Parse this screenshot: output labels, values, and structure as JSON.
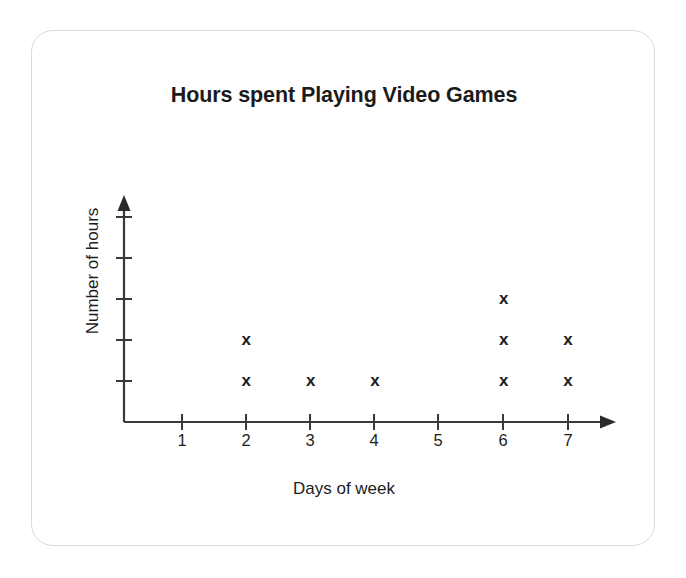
{
  "chart_data": {
    "type": "scatter",
    "plot_style": "dot-plot",
    "title": "Hours spent Playing Video Games",
    "xlabel": "Days of week",
    "ylabel": "Number of hours",
    "marker": "x",
    "categories": [
      "1",
      "2",
      "3",
      "4",
      "5",
      "6",
      "7"
    ],
    "values": [
      0,
      2,
      1,
      1,
      0,
      3,
      2
    ],
    "x": [
      1,
      2,
      3,
      4,
      5,
      6,
      7
    ],
    "xlim": [
      0,
      7.6
    ],
    "ylim": [
      0,
      5.5
    ],
    "x_tick_labels": [
      "1",
      "2",
      "3",
      "4",
      "5",
      "6",
      "7"
    ],
    "y_tick_labels": [
      "",
      "",
      "",
      "",
      ""
    ],
    "y_tick_count": 5,
    "grid": false,
    "legend": false,
    "axis_arrows": true,
    "points": [
      {
        "x": 2,
        "y": 1
      },
      {
        "x": 2,
        "y": 2
      },
      {
        "x": 3,
        "y": 1
      },
      {
        "x": 4,
        "y": 1
      },
      {
        "x": 6,
        "y": 1
      },
      {
        "x": 6,
        "y": 2
      },
      {
        "x": 6,
        "y": 3
      },
      {
        "x": 7,
        "y": 1
      },
      {
        "x": 7,
        "y": 2
      }
    ]
  },
  "colors": {
    "ink": "#1d1d1d",
    "title": "#1b1b1b",
    "axis": "#3a3a3a",
    "card_border": "#d9d9d9",
    "background": "#ffffff"
  }
}
